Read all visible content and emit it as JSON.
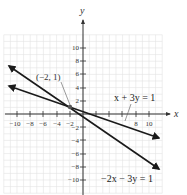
{
  "chart_data": {
    "type": "line",
    "title": "",
    "xlabel": "x",
    "ylabel": "y",
    "xlim": [
      -12,
      12
    ],
    "ylim": [
      -12,
      12
    ],
    "grid": true,
    "x_ticks": [
      -10,
      -8,
      -6,
      -4,
      -2,
      8,
      10
    ],
    "y_ticks": [
      10,
      8,
      6,
      4,
      2,
      -2,
      -4,
      -6,
      -8,
      -10
    ],
    "series": [
      {
        "name": "x + 3y = 1",
        "equation": "x + 3y = 1",
        "slope": -0.3333,
        "intercept": 0.3333,
        "x": [
          -11.5,
          12
        ],
        "values": [
          4.17,
          -3.67
        ]
      },
      {
        "name": "-2x - 3y = 1",
        "equation": "−2x − 3y = 1",
        "slope": -0.6667,
        "intercept": -0.3333,
        "x": [
          -11.5,
          12
        ],
        "values": [
          7.33,
          -8.33
        ]
      }
    ],
    "annotations": [
      {
        "text": "(−2, 1)",
        "x": -2,
        "y": 1,
        "type": "intersection-point"
      }
    ]
  },
  "labels": {
    "x_axis": "x",
    "y_axis": "y",
    "line1": "x + 3y = 1",
    "line2": "−2x − 3y = 1",
    "point": "(−2, 1)",
    "xt": {
      "m10": "−10",
      "m8": "−8",
      "m6": "−6",
      "m4": "−4",
      "m2": "−2",
      "p8": "8",
      "p10": "10"
    },
    "yt": {
      "p10": "10",
      "p8": "8",
      "p6": "6",
      "p4": "4",
      "p2": "2",
      "m2": "−2",
      "m4": "−4",
      "m6": "−6",
      "m8": "−8",
      "m10": "−10"
    }
  }
}
